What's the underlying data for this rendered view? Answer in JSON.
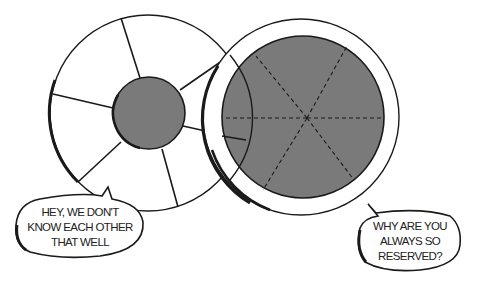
{
  "illustration": {
    "description": "Two circular diagrams comparing a wheel with a small core and a closed circle with a large core",
    "colors": {
      "background": "#ffffff",
      "line": "#1a1a1a",
      "core_fill": "#7a7a7a"
    },
    "left_figure": {
      "name": "open-wheel",
      "spokes": 6,
      "core": "small"
    },
    "right_figure": {
      "name": "closed-circle",
      "dashed_divisions": 6,
      "core": "large"
    }
  },
  "bubbles": {
    "left": {
      "lines": [
        "HEY, WE DON'T",
        "KNOW EACH OTHER",
        "THAT WELL"
      ]
    },
    "right": {
      "lines": [
        "WHY ARE YOU",
        "ALWAYS SO",
        "RESERVED?"
      ]
    }
  }
}
